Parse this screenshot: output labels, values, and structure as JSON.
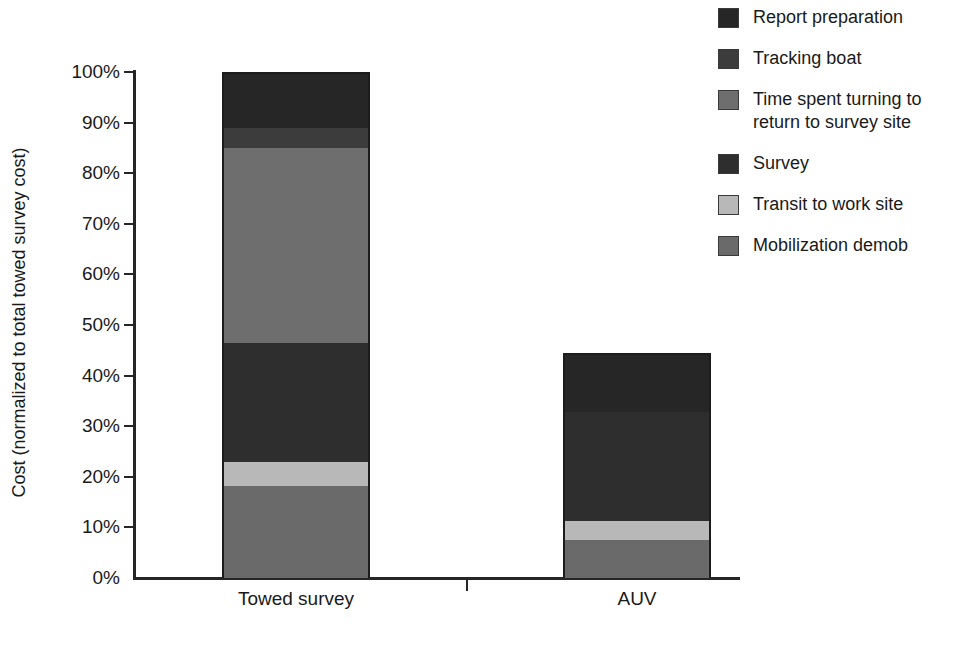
{
  "chart_data": {
    "type": "bar",
    "subtype": "stacked-bar",
    "title": "",
    "xlabel": "",
    "ylabel": "Cost (normalized to total towed survey cost)",
    "categories": [
      "Towed survey",
      "AUV"
    ],
    "ylim": [
      0,
      100
    ],
    "ytick_labels": [
      "0%",
      "10%",
      "20%",
      "30%",
      "40%",
      "50%",
      "60%",
      "70%",
      "80%",
      "90%",
      "100%"
    ],
    "ytick_values": [
      0,
      10,
      20,
      30,
      40,
      50,
      60,
      70,
      80,
      90,
      100
    ],
    "yunit": "%",
    "grid": false,
    "legend_position": "right",
    "series": [
      {
        "name": "Mobilization demob",
        "color": "#6a6a6a",
        "values": [
          18.2,
          7.5
        ]
      },
      {
        "name": "Transit to work site",
        "color": "#b8b8b8",
        "values": [
          4.7,
          3.8
        ]
      },
      {
        "name": "Survey",
        "color": "#2e2e2e",
        "values": [
          23.5,
          21.5
        ]
      },
      {
        "name": "Time spent turning to return to survey site",
        "color": "#6e6e6e",
        "values": [
          38.6,
          0
        ]
      },
      {
        "name": "Tracking boat",
        "color": "#3c3c3c",
        "values": [
          4.0,
          0
        ]
      },
      {
        "name": "Report preparation",
        "color": "#262626",
        "values": [
          11.0,
          11.7
        ]
      }
    ],
    "totals": [
      100.0,
      44.5
    ]
  },
  "legend": {
    "items": [
      {
        "label": "Report preparation",
        "color": "#262626"
      },
      {
        "label": "Tracking boat",
        "color": "#3c3c3c"
      },
      {
        "label": "Time spent turning to return to survey site",
        "color": "#6e6e6e"
      },
      {
        "label": "Survey",
        "color": "#2e2e2e"
      },
      {
        "label": "Transit to work site",
        "color": "#b8b8b8"
      },
      {
        "label": "Mobilization demob",
        "color": "#6a6a6a"
      }
    ]
  },
  "axes": {
    "y_title": "Cost (normalized to total towed survey cost)",
    "y_ticks": [
      "100%",
      "90%",
      "80%",
      "70%",
      "60%",
      "50%",
      "40%",
      "30%",
      "20%",
      "10%",
      "0%"
    ],
    "x_categories": [
      "Towed survey",
      "AUV"
    ]
  }
}
